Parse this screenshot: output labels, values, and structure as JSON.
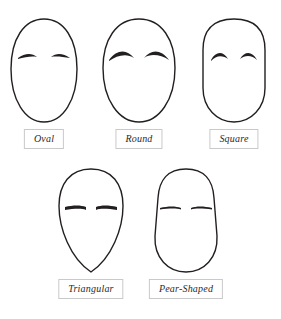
{
  "diagram": {
    "background_color": "#ffffff",
    "outline_color": "#231f20",
    "label_border_color": "#c9c9c9",
    "label_text_color": "#2b2b2b",
    "rows": [
      {
        "row_index": 1,
        "faces": [
          {
            "id": "oval",
            "label": "Oval"
          },
          {
            "id": "round",
            "label": "Round"
          },
          {
            "id": "square",
            "label": "Square"
          }
        ]
      },
      {
        "row_index": 2,
        "faces": [
          {
            "id": "triangular",
            "label": "Triangular"
          },
          {
            "id": "pear-shaped",
            "label": "Pear-Shaped"
          }
        ]
      }
    ],
    "labels": {
      "oval": "Oval",
      "round": "Round",
      "square": "Square",
      "triangular": "Triangular",
      "pear_shaped": "Pear-Shaped"
    }
  }
}
